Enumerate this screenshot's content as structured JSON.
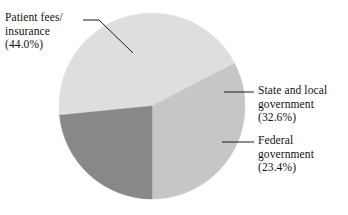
{
  "chart_data": {
    "type": "pie",
    "title": "",
    "subtitle": "",
    "xlabel": "",
    "ylabel": "",
    "legend_position": "callout-labels",
    "grid": false,
    "categories": [
      "Patient fees/insurance",
      "State and local government",
      "Federal government"
    ],
    "values": [
      44.0,
      32.6,
      23.4
    ],
    "units": "percent",
    "colors": [
      "#dedede",
      "#c6c6c6",
      "#888888"
    ],
    "slices": [
      {
        "name": "Patient fees/insurance",
        "value": 44.0,
        "value_label": "(44.0%)",
        "color": "#dedede",
        "start_angle_deg": 180,
        "end_angle_deg": 338.4
      },
      {
        "name": "State and local government",
        "value": 32.6,
        "value_label": "(32.6%)",
        "color": "#c6c6c6",
        "start_angle_deg": 338.4,
        "end_angle_deg": 90
      },
      {
        "name": "Federal government",
        "value": 23.4,
        "value_label": "(23.4%)",
        "color": "#888888",
        "start_angle_deg": 90,
        "end_angle_deg": 180
      }
    ],
    "annotations": [
      "Patient fees/",
      "insurance",
      "(44.0%)",
      "State and local",
      "government",
      "(32.6%)",
      "Federal",
      "government",
      "(23.4%)"
    ]
  },
  "labels": {
    "patient": {
      "line1": "Patient fees/",
      "line2": "insurance",
      "line3": "(44.0%)"
    },
    "state": {
      "line1": "State and local",
      "line2": "government",
      "line3": "(32.6%)"
    },
    "federal": {
      "line1": "Federal",
      "line2": "government",
      "line3": "(23.4%)"
    }
  },
  "style": {
    "background": "#ffffff",
    "leader_line_color": "#1a1a1a",
    "text_color": "#111111"
  }
}
